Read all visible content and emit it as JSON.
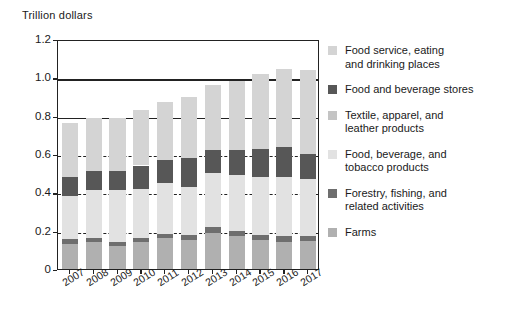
{
  "chart_data": {
    "type": "bar",
    "subtype": "stacked-bar",
    "title": "",
    "ylabel": "Trillion dollars",
    "xlabel": "",
    "ylim": [
      0,
      1.2
    ],
    "yticks": [
      "0",
      "0.2",
      "0.4",
      "0.6",
      "0.8",
      "1.0",
      "1.2"
    ],
    "ytick_values": [
      0,
      0.2,
      0.4,
      0.6,
      0.8,
      1.0,
      1.2
    ],
    "grid": "dashed horizontal gridlines at 0.2, 0.4, 0.6; solid rules at 0.8 and 1.0",
    "legend_position": "right",
    "categories": [
      "2007",
      "2008",
      "2009",
      "2010",
      "2011",
      "2012",
      "2013",
      "2014",
      "2015",
      "2016",
      "2017"
    ],
    "series": [
      {
        "name": "Farms",
        "color": "#b0b0b0",
        "values": [
          0.13,
          0.14,
          0.12,
          0.14,
          0.16,
          0.15,
          0.19,
          0.17,
          0.15,
          0.14,
          0.145
        ]
      },
      {
        "name": "Forestry, fishing, and related activities",
        "color": "#6e6e6e",
        "values": [
          0.025,
          0.02,
          0.02,
          0.02,
          0.025,
          0.025,
          0.03,
          0.03,
          0.03,
          0.03,
          0.025
        ]
      },
      {
        "name": "Food, beverage, and tobacco products",
        "color": "#e2e2e2",
        "values": [
          0.225,
          0.25,
          0.27,
          0.26,
          0.265,
          0.255,
          0.28,
          0.29,
          0.3,
          0.31,
          0.3
        ]
      },
      {
        "name": "Textile, apparel, and leather products",
        "color": "#c4c4c4",
        "values": [
          0.0,
          0.0,
          0.0,
          0.0,
          0.0,
          0.0,
          0.0,
          0.0,
          0.0,
          0.0,
          0.0
        ]
      },
      {
        "name": "Food and beverage stores",
        "color": "#575757",
        "values": [
          0.1,
          0.1,
          0.1,
          0.12,
          0.12,
          0.15,
          0.12,
          0.13,
          0.145,
          0.155,
          0.13
        ]
      },
      {
        "name": "Food service, eating and drinking places",
        "color": "#d4d4d4",
        "values": [
          0.28,
          0.28,
          0.28,
          0.29,
          0.3,
          0.32,
          0.34,
          0.36,
          0.39,
          0.41,
          0.44
        ]
      }
    ],
    "totals": [
      0.76,
      0.785,
      0.81,
      0.835,
      0.87,
      0.9,
      0.955,
      0.98,
      1.015,
      1.055,
      1.04
    ]
  },
  "legend": {
    "items": [
      {
        "label_line1": "Food service,  eating",
        "label_line2": "and drinking  places",
        "color": "#d4d4d4",
        "swatch_name": "legend-swatch-food-service"
      },
      {
        "label_line1": "Food and beverage  stores",
        "label_line2": "",
        "color": "#575757",
        "swatch_name": "legend-swatch-food-beverage-stores"
      },
      {
        "label_line1": "Textile,  apparel, and",
        "label_line2": "leather products",
        "color": "#c4c4c4",
        "swatch_name": "legend-swatch-textile"
      },
      {
        "label_line1": "Food,  beverage, and",
        "label_line2": "tobacco products",
        "color": "#e2e2e2",
        "swatch_name": "legend-swatch-food-beverage-tobacco"
      },
      {
        "label_line1": "Forestry,  fishing, and",
        "label_line2": "related activities",
        "color": "#6e6e6e",
        "swatch_name": "legend-swatch-forestry"
      },
      {
        "label_line1": "Farms",
        "label_line2": "",
        "color": "#b0b0b0",
        "swatch_name": "legend-swatch-farms"
      }
    ]
  },
  "axis": {
    "y_title": "Trillion  dollars"
  }
}
